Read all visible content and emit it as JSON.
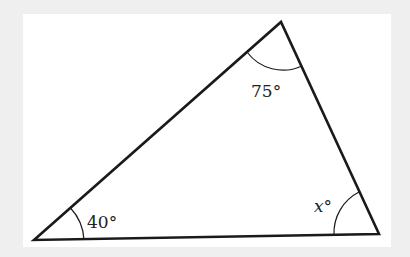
{
  "diagram": {
    "type": "triangle",
    "stroke_color": "#1a1a1a",
    "background_color": "#efefef",
    "card_color": "#ffffff",
    "vertices": {
      "bottom_left": [
        34,
        240
      ],
      "top": [
        281,
        22
      ],
      "bottom_right": [
        379,
        234
      ]
    },
    "angles": {
      "bottom_left": {
        "label": "40°",
        "value": 40
      },
      "top": {
        "label": "75°",
        "value": 75
      },
      "bottom_right": {
        "label": "x°",
        "variable": "x",
        "unit": "°"
      }
    }
  }
}
